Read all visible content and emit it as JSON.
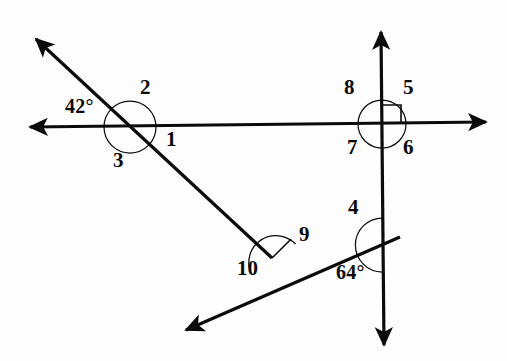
{
  "figure": {
    "type": "geometry-diagram",
    "width": 507,
    "height": 361,
    "background_color": "#fdfdfd",
    "stroke_color": "#0b0b0b"
  },
  "lines": [
    {
      "name": "horizontal-line",
      "description": "Horizontal double-headed arrow crossing both vertical and diagonal lines",
      "x1": 30,
      "y1": 127,
      "x2": 486,
      "y2": 122,
      "arrow_start": true,
      "arrow_end": true
    },
    {
      "name": "vertical-line",
      "description": "Vertical double-headed arrow on the right side",
      "x1": 381,
      "y1": 32,
      "x2": 384,
      "y2": 345,
      "arrow_start": true,
      "arrow_end": true
    },
    {
      "name": "diagonal-line-upper",
      "description": "Diagonal from upper-left down to the right, meeting the lower diagonal",
      "x1": 36,
      "y1": 39,
      "x2": 272,
      "y2": 258,
      "arrow_start": true,
      "arrow_end": false
    },
    {
      "name": "diagonal-line-lower",
      "description": "Diagonal from lower-left up to the right, crossing the vertical line",
      "x1": 186,
      "y1": 330,
      "x2": 400,
      "y2": 237,
      "arrow_start": true,
      "arrow_end": false
    }
  ],
  "vertices": [
    {
      "name": "left-intersection",
      "x": 130,
      "y": 127,
      "description": "horizontal line crosses upper diagonal"
    },
    {
      "name": "right-intersection",
      "x": 382,
      "y": 124,
      "description": "horizontal line crosses vertical line, right angle"
    },
    {
      "name": "lower-vertex",
      "x": 272,
      "y": 258,
      "description": "upper diagonal meets lower diagonal"
    },
    {
      "name": "lower-right-intersection",
      "x": 383,
      "y": 245,
      "description": "lower diagonal crosses vertical line"
    }
  ],
  "arcs": [
    {
      "name": "arc-left-full-circle",
      "cx": 130,
      "cy": 127,
      "r": 26,
      "description": "full circle arc around left intersection"
    },
    {
      "name": "arc-right-full-circle",
      "cx": 382,
      "cy": 124,
      "r": 24,
      "description": "full circle arc around right intersection"
    },
    {
      "name": "arc-lower-vertex",
      "cx": 272,
      "cy": 258,
      "r": 27,
      "description": "arc spanning angles 9 and 10"
    },
    {
      "name": "arc-lower-right",
      "cx": 383,
      "cy": 245,
      "r": 27,
      "description": "arc spanning angle 4 and 64 degrees"
    }
  ],
  "right_angle_marker": {
    "name": "right-angle-square",
    "description": "Square marker indicating 90 degrees in upper-right quadrant of right intersection",
    "x": 382,
    "y": 124,
    "size": 19
  },
  "labels": [
    {
      "id": "label-1",
      "text": "1",
      "x": 166,
      "y": 129,
      "kind": "angle-number"
    },
    {
      "id": "label-2",
      "text": "2",
      "x": 140,
      "y": 77,
      "kind": "angle-number"
    },
    {
      "id": "label-3",
      "text": "3",
      "x": 113,
      "y": 150,
      "kind": "angle-number"
    },
    {
      "id": "label-4",
      "text": "4",
      "x": 348,
      "y": 197,
      "kind": "angle-number"
    },
    {
      "id": "label-5",
      "text": "5",
      "x": 403,
      "y": 77,
      "kind": "angle-number"
    },
    {
      "id": "label-6",
      "text": "6",
      "x": 403,
      "y": 137,
      "kind": "angle-number"
    },
    {
      "id": "label-7",
      "text": "7",
      "x": 347,
      "y": 137,
      "kind": "angle-number"
    },
    {
      "id": "label-8",
      "text": "8",
      "x": 344,
      "y": 77,
      "kind": "angle-number"
    },
    {
      "id": "label-9",
      "text": "9",
      "x": 299,
      "y": 224,
      "kind": "angle-number"
    },
    {
      "id": "label-10",
      "text": "10",
      "x": 237,
      "y": 258,
      "kind": "angle-number"
    },
    {
      "id": "label-42",
      "text": "42°",
      "x": 65,
      "y": 96,
      "kind": "degree-measure"
    },
    {
      "id": "label-64",
      "text": "64°",
      "x": 336,
      "y": 262,
      "kind": "degree-measure"
    }
  ],
  "given_measures": {
    "angle_at_left_intersection": "42°",
    "angle_at_lower_right_intersection": "64°",
    "right_angle": "90°"
  }
}
